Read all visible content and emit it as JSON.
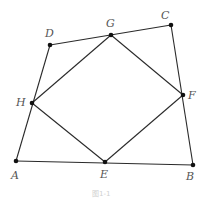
{
  "figure": {
    "caption": "图1-1",
    "points": {
      "A": {
        "label": "A",
        "x": 16,
        "y": 161
      },
      "B": {
        "label": "B",
        "x": 193,
        "y": 165
      },
      "C": {
        "label": "C",
        "x": 171,
        "y": 25
      },
      "D": {
        "label": "D",
        "x": 50,
        "y": 45
      },
      "E": {
        "label": "E",
        "x": 105,
        "y": 162
      },
      "F": {
        "label": "F",
        "x": 183,
        "y": 95
      },
      "G": {
        "label": "G",
        "x": 111,
        "y": 35
      },
      "H": {
        "label": "H",
        "x": 32,
        "y": 103
      }
    },
    "quadrilateral_outer": [
      "A",
      "B",
      "C",
      "D"
    ],
    "quadrilateral_inner": [
      "E",
      "F",
      "G",
      "H"
    ],
    "colors": {
      "line": "#2a2a2a",
      "point": "#111111",
      "label": "#555555"
    }
  }
}
